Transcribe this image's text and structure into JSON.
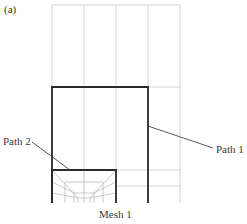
{
  "figure": {
    "panel_label": "(a)",
    "caption": "Mesh 1",
    "labels": {
      "path1": "Path 1",
      "path2": "Path 2"
    }
  },
  "colors": {
    "grid": "#c8c8c8",
    "fine_mesh": "#b4b4b4",
    "path": "#2a2a2a",
    "leader": "#444444"
  }
}
